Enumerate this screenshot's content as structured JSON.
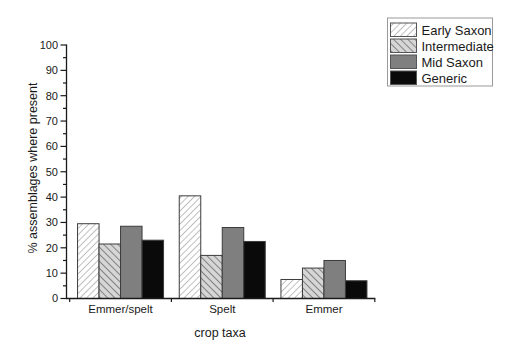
{
  "chart_data": {
    "type": "bar",
    "title": "",
    "xlabel": "crop taxa",
    "ylabel": "% assemblages where present",
    "categories": [
      "Emmer/spelt",
      "Spelt",
      "Emmer"
    ],
    "series": [
      {
        "name": "Early Saxon",
        "pattern": "diagonal-up",
        "values": [
          29.5,
          40.5,
          7.5
        ]
      },
      {
        "name": "Intermediate",
        "pattern": "diagonal-down",
        "values": [
          21.5,
          17.0,
          12.0
        ]
      },
      {
        "name": "Mid Saxon",
        "pattern": "solid-gray",
        "values": [
          28.5,
          28.0,
          15.0
        ]
      },
      {
        "name": "Generic",
        "pattern": "solid-black",
        "values": [
          23.0,
          22.5,
          7.0
        ]
      }
    ],
    "ylim": [
      0,
      100
    ],
    "ytick_step": 10,
    "ytick_minor_step": 5,
    "yticks": [
      0,
      10,
      20,
      30,
      40,
      50,
      60,
      70,
      80,
      90,
      100
    ],
    "grid": false,
    "legend_position": "top-right"
  },
  "colors": {
    "background": "#ffffff",
    "axis": "#1a1a1a",
    "text": "#1a1a1a",
    "bar_outline": "#3c3c3c",
    "hatch_up_bg": "#ffffff",
    "hatch_up_line": "#8f8f8f",
    "hatch_down_bg": "#d6d6d6",
    "hatch_down_line": "#7a7a7a",
    "mid_saxon_gray": "#7f7f7f",
    "generic_black": "#0a0a0a",
    "legend_border": "#9a9a9a",
    "legend_bg": "#ffffff"
  }
}
